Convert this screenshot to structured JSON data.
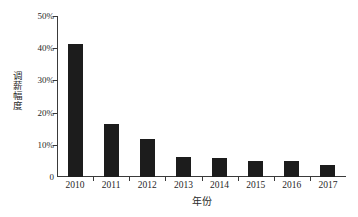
{
  "chart_data": {
    "type": "bar",
    "title": "",
    "categories": [
      "2010",
      "2011",
      "2012",
      "2013",
      "2014",
      "2015",
      "2016",
      "2017"
    ],
    "values": [
      41.3,
      16.4,
      11.8,
      6.2,
      5.9,
      5.0,
      5.0,
      3.7
    ],
    "xlabel": "年份",
    "ylabel": "调薪幅度",
    "ylim": [
      0,
      50
    ],
    "y_ticks": [
      0,
      10,
      20,
      30,
      40,
      50
    ],
    "y_tick_labels": [
      "0",
      "10%",
      "20%",
      "30%",
      "40%",
      "50%"
    ],
    "grid": false,
    "legend": null,
    "bar_color": "#1c1c1c",
    "axis_color": "#3a3a3a"
  },
  "caption": {
    "text": ""
  }
}
